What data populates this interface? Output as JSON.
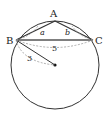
{
  "diagram": {
    "type": "geometry",
    "points": {
      "A": {
        "label": "A",
        "x": 55,
        "y": 21
      },
      "B": {
        "label": "B",
        "x": 16,
        "y": 40
      },
      "C": {
        "label": "C",
        "x": 93,
        "y": 40
      },
      "O": {
        "label": "",
        "x": 55,
        "y": 65
      }
    },
    "circle": {
      "cx": 55,
      "cy": 65,
      "r": 44
    },
    "measures": {
      "AB": "a",
      "AC": "b",
      "BC": "5",
      "radius": "3"
    },
    "colors": {
      "stroke": "#333333",
      "dashed": "#999999"
    }
  }
}
